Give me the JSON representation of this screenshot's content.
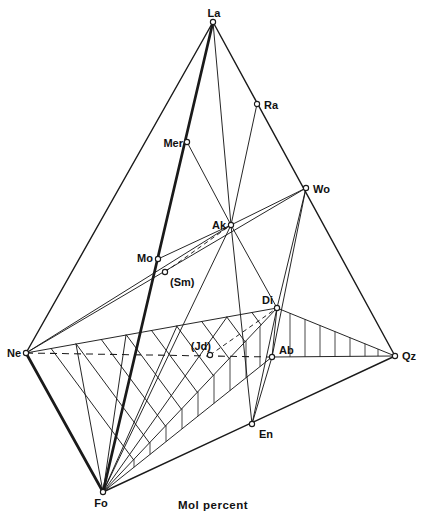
{
  "figure": {
    "caption": "Mol percent",
    "background": "#ffffff",
    "line_color": "#1a1a1a"
  },
  "diagram": {
    "type": "tetrahedron-phase-diagram",
    "caption_x": 178,
    "caption_y": 509,
    "points": [
      {
        "id": "La",
        "label": "La",
        "x": 213,
        "y": 22,
        "label_x": 214,
        "label_y": 17,
        "anchor": "middle"
      },
      {
        "id": "Ra",
        "label": "Ra",
        "x": 257,
        "y": 104,
        "label_x": 264,
        "label_y": 109,
        "anchor": "start"
      },
      {
        "id": "Mer",
        "label": "Mer",
        "x": 187,
        "y": 142,
        "label_x": 183,
        "label_y": 147,
        "anchor": "end"
      },
      {
        "id": "Wo",
        "label": "Wo",
        "x": 306,
        "y": 188,
        "label_x": 313,
        "label_y": 193,
        "anchor": "start"
      },
      {
        "id": "Ak",
        "label": "Ak",
        "x": 231,
        "y": 225,
        "label_x": 226,
        "label_y": 229,
        "anchor": "end"
      },
      {
        "id": "Mo",
        "label": "Mo",
        "x": 158,
        "y": 259,
        "label_x": 153,
        "label_y": 262,
        "anchor": "end"
      },
      {
        "id": "Sm",
        "label": "(Sm)",
        "x": 165,
        "y": 272,
        "label_x": 170,
        "label_y": 286,
        "anchor": "start"
      },
      {
        "id": "Di",
        "label": "Di",
        "x": 277,
        "y": 308,
        "label_x": 273,
        "label_y": 304,
        "anchor": "end"
      },
      {
        "id": "Jd",
        "label": "(Jd)",
        "x": 210,
        "y": 355,
        "label_x": 211,
        "label_y": 350,
        "anchor": "end"
      },
      {
        "id": "Ne",
        "label": "Ne",
        "x": 26,
        "y": 353,
        "label_x": 21,
        "label_y": 357,
        "anchor": "end"
      },
      {
        "id": "Ab",
        "label": "Ab",
        "x": 272,
        "y": 357,
        "label_x": 279,
        "label_y": 354,
        "anchor": "start"
      },
      {
        "id": "Qz",
        "label": "Qz",
        "x": 395,
        "y": 356,
        "label_x": 402,
        "label_y": 360,
        "anchor": "start"
      },
      {
        "id": "En",
        "label": "En",
        "x": 252,
        "y": 424,
        "label_x": 259,
        "label_y": 438,
        "anchor": "start"
      },
      {
        "id": "Fo",
        "label": "Fo",
        "x": 103,
        "y": 492,
        "label_x": 101,
        "label_y": 507,
        "anchor": "middle"
      }
    ],
    "lines": [
      {
        "name": "edge-la-ne",
        "from": "La",
        "to": "Ne",
        "style": "medium"
      },
      {
        "name": "edge-la-qz",
        "from": "La",
        "to": "Qz",
        "style": "medium"
      },
      {
        "name": "edge-fo-qz",
        "from": "Fo",
        "to": "Qz",
        "style": "medium"
      },
      {
        "name": "edge-la-fo",
        "from": "La",
        "to": "Fo",
        "style": "thick"
      },
      {
        "name": "edge-ne-fo",
        "from": "Ne",
        "to": "Fo",
        "style": "thick"
      },
      {
        "name": "edge-ne-ab-hidden",
        "from": "Ne",
        "to": "Ab",
        "style": "dashed-long"
      },
      {
        "name": "edge-ab-qz",
        "from": "Ab",
        "to": "Qz",
        "style": "thin"
      },
      {
        "name": "join-ne-ak",
        "from": "Ne",
        "to": "Ak",
        "style": "thin"
      },
      {
        "name": "join-ne-wo",
        "from": "Ne",
        "to": "Wo",
        "style": "thin"
      },
      {
        "name": "join-ak-wo",
        "from": "Ak",
        "to": "Wo",
        "style": "thin"
      },
      {
        "name": "join-mo-ak",
        "from": "Mo",
        "to": "Ak",
        "style": "thin"
      },
      {
        "name": "join-mer-ak",
        "from": "Mer",
        "to": "Ak",
        "style": "thin"
      },
      {
        "name": "join-ra-ak",
        "from": "Ra",
        "to": "Ak",
        "style": "thin"
      },
      {
        "name": "join-la-ak",
        "from": "La",
        "to": "Ak",
        "style": "thin"
      },
      {
        "name": "join-ak-en",
        "from": "Ak",
        "to": "En",
        "style": "thin"
      },
      {
        "name": "join-ak-di",
        "from": "Ak",
        "to": "Di",
        "style": "thin"
      },
      {
        "name": "join-ak-fo",
        "from": "Ak",
        "to": "Fo",
        "style": "thin"
      },
      {
        "name": "join-ne-di",
        "from": "Ne",
        "to": "Di",
        "style": "thin"
      },
      {
        "name": "join-wo-di",
        "from": "Wo",
        "to": "Di",
        "style": "thin"
      },
      {
        "name": "join-wo-ab",
        "from": "Wo",
        "to": "Ab",
        "style": "thin"
      },
      {
        "name": "join-di-en",
        "from": "Di",
        "to": "En",
        "style": "thin"
      },
      {
        "name": "join-di-ab",
        "from": "Di",
        "to": "Ab",
        "style": "thin"
      },
      {
        "name": "join-ab-en",
        "from": "Ab",
        "to": "En",
        "style": "thin"
      },
      {
        "name": "join-di-qz",
        "from": "Di",
        "to": "Qz",
        "style": "thin"
      },
      {
        "name": "join-di-fo",
        "from": "Di",
        "to": "Fo",
        "style": "thin"
      },
      {
        "name": "join-ab-fo",
        "from": "Ab",
        "to": "Fo",
        "style": "thin"
      },
      {
        "name": "join-sm-ak-metastable",
        "from": "Sm",
        "to": "Ak",
        "style": "dashed"
      },
      {
        "name": "join-jd-di-metastable",
        "from": "Jd",
        "to": "Di",
        "style": "dashed"
      }
    ],
    "hatch": {
      "parallel_chords": [
        [
          51.1,
          348.5,
          133.5,
          459.7
        ],
        [
          76.2,
          344.0,
          149.4,
          442.8
        ],
        [
          101.3,
          339.5,
          165.4,
          426.0
        ],
        [
          126.4,
          335.0,
          181.3,
          409.1
        ],
        [
          151.5,
          330.5,
          197.3,
          392.3
        ],
        [
          176.6,
          326.0,
          213.2,
          375.4
        ],
        [
          201.7,
          321.5,
          229.2,
          358.6
        ],
        [
          226.8,
          317.0,
          245.1,
          341.7
        ],
        [
          251.9,
          312.5,
          261.1,
          324.9
        ]
      ],
      "fan_from_fo": [
        [
          76,
          344
        ],
        [
          126,
          335
        ],
        [
          177,
          326
        ],
        [
          227,
          317
        ]
      ],
      "ticks_plane_fo_di_ab": [
        [
          134,
          459.2,
          134,
          467.2
        ],
        [
          150,
          442.3,
          150,
          454.5
        ],
        [
          166,
          425.4,
          166,
          441.7
        ],
        [
          182,
          408.5,
          182,
          428.9
        ],
        [
          198,
          391.5,
          198,
          416.1
        ],
        [
          214,
          374.6,
          214,
          403.4
        ],
        [
          230,
          357.7,
          230,
          390.6
        ],
        [
          246,
          340.8,
          246,
          377.8
        ],
        [
          260,
          326.0,
          260,
          366.6
        ]
      ],
      "ticks_plane_di_ab_qz": [
        [
          290,
          313.3,
          290,
          356.9
        ],
        [
          305,
          319.4,
          305,
          356.7
        ],
        [
          320,
          325.5,
          320,
          356.6
        ],
        [
          335,
          331.6,
          335,
          356.5
        ],
        [
          350,
          337.7,
          350,
          356.4
        ],
        [
          365,
          343.8,
          365,
          356.2
        ],
        [
          378,
          349.1,
          378,
          356.1
        ]
      ]
    }
  }
}
